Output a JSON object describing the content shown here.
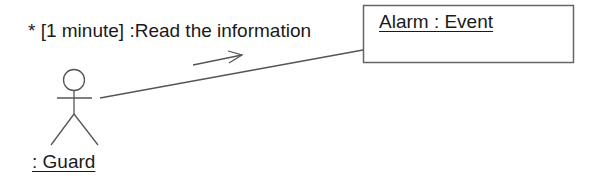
{
  "diagram": {
    "type": "uml-collaboration",
    "message": {
      "label": "* [1 minute] :Read the information",
      "direction": "actor-to-object"
    },
    "object": {
      "label": "Alarm : Event"
    },
    "actor": {
      "label": ": Guard"
    },
    "colors": {
      "stroke": "#555555",
      "text": "#1a1a1a",
      "background": "#ffffff"
    }
  }
}
